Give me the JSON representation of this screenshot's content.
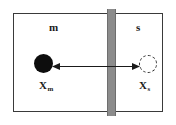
{
  "diagram": {
    "compartments": [
      {
        "id": "left",
        "label": "m",
        "name": "membrane-phase-compartment"
      },
      {
        "id": "right",
        "label": "s",
        "name": "solution-phase-compartment"
      }
    ],
    "barrier": {
      "name": "membrane-barrier",
      "color": "#8c8c8c"
    },
    "species": [
      {
        "id": "left",
        "marker": "filled-circle",
        "color": "#0d0d0d",
        "symbol": "X",
        "subscript": "m"
      },
      {
        "id": "right",
        "marker": "dashed-circle",
        "color": "#ffffff",
        "outline": "#2b2b2b",
        "symbol": "X",
        "subscript": "s"
      }
    ],
    "arrow": {
      "name": "bidirectional-transport-arrow",
      "style": "double-headed",
      "color": "#1a1a1a"
    },
    "frame": {
      "border_color": "#3a3a3a",
      "background": "#ffffff"
    }
  }
}
